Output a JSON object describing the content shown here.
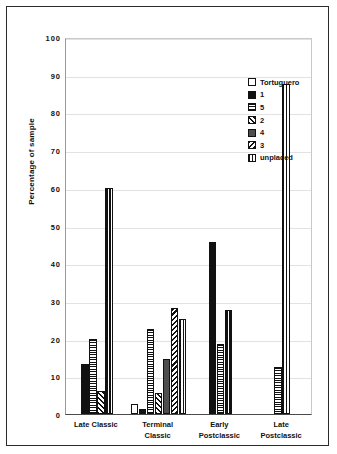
{
  "chart_data": {
    "type": "bar",
    "title": "",
    "xlabel": "",
    "ylabel": "Percentage of sample",
    "ylim": [
      0,
      100
    ],
    "yticks": [
      "100",
      "90",
      "80",
      "70",
      "60",
      "50",
      "40",
      "30",
      "20",
      "10",
      "0"
    ],
    "grid": true,
    "legend_position": "top-right",
    "categories": [
      "Late Classic",
      "Terminal Classic",
      "Early Postclassic",
      "Late Postclassic"
    ],
    "category_lines": [
      [
        "Late Classic"
      ],
      [
        "Terminal",
        "Classic"
      ],
      [
        "Early",
        "Postclassic"
      ],
      [
        "Late",
        "Postclassic"
      ]
    ],
    "series": [
      {
        "name": "Tortuguero",
        "pattern": "open-white",
        "values": [
          0,
          2.7,
          0,
          0
        ]
      },
      {
        "name": "1",
        "pattern": "solid-black",
        "values": [
          13.3,
          1.4,
          45.5,
          0
        ]
      },
      {
        "name": "5",
        "pattern": "horizontal-stripes",
        "values": [
          20.0,
          22.6,
          18.5,
          12.5
        ]
      },
      {
        "name": "2",
        "pattern": "diagonal-backslash",
        "values": [
          6.1,
          5.5,
          0,
          0
        ]
      },
      {
        "name": "4",
        "pattern": "solid-dark-gray",
        "values": [
          0,
          14.6,
          0,
          0
        ]
      },
      {
        "name": "3",
        "pattern": "diagonal-slash",
        "values": [
          0,
          28.2,
          0,
          0
        ]
      },
      {
        "name": "unplaced",
        "pattern": "vertical-stripes",
        "values": [
          60.0,
          25.3,
          27.5,
          87.5
        ]
      }
    ]
  },
  "legend": {
    "items": [
      {
        "label": "Tortuguero",
        "swatch": "p-tortuguero"
      },
      {
        "label": "1",
        "swatch": "p-1"
      },
      {
        "label": "5",
        "swatch": "p-5"
      },
      {
        "label": "2",
        "swatch": "p-2"
      },
      {
        "label": "4",
        "swatch": "p-4"
      },
      {
        "label": "3",
        "swatch": "p-3"
      },
      {
        "label": "unplaced",
        "swatch": "p-unplaced"
      }
    ]
  }
}
